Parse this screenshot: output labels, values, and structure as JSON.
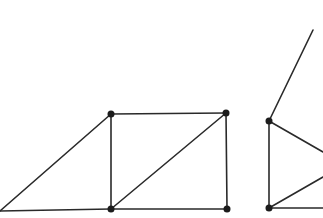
{
  "diagram": {
    "type": "graph",
    "colors": {
      "background": "#ffffff",
      "edge": "#2a2a2a",
      "node": "#1c1c1c"
    },
    "node_radius": 3.5,
    "figures": [
      {
        "id": "left-figure",
        "nodes": [
          {
            "id": "A",
            "x": 0,
            "y": 211,
            "dot": false
          },
          {
            "id": "B",
            "x": 111,
            "y": 114,
            "dot": true
          },
          {
            "id": "C",
            "x": 226,
            "y": 113,
            "dot": true
          },
          {
            "id": "D",
            "x": 111,
            "y": 209,
            "dot": true
          },
          {
            "id": "E",
            "x": 227,
            "y": 209,
            "dot": true
          }
        ],
        "edges": [
          [
            "A",
            "B"
          ],
          [
            "A",
            "D"
          ],
          [
            "B",
            "C"
          ],
          [
            "B",
            "D"
          ],
          [
            "C",
            "E"
          ],
          [
            "D",
            "E"
          ],
          [
            "D",
            "C"
          ]
        ]
      },
      {
        "id": "right-figure",
        "nodes": [
          {
            "id": "F",
            "x": 269,
            "y": 121,
            "dot": true
          },
          {
            "id": "G",
            "x": 269,
            "y": 208,
            "dot": true
          },
          {
            "id": "H",
            "x": 313,
            "y": 30,
            "dot": false
          },
          {
            "id": "I",
            "x": 323,
            "y": 152,
            "dot": false
          },
          {
            "id": "J",
            "x": 323,
            "y": 177,
            "dot": false
          },
          {
            "id": "K",
            "x": 323,
            "y": 208,
            "dot": false
          }
        ],
        "edges": [
          [
            "F",
            "H"
          ],
          [
            "F",
            "G"
          ],
          [
            "F",
            "I"
          ],
          [
            "G",
            "J"
          ],
          [
            "G",
            "K"
          ]
        ]
      }
    ]
  }
}
